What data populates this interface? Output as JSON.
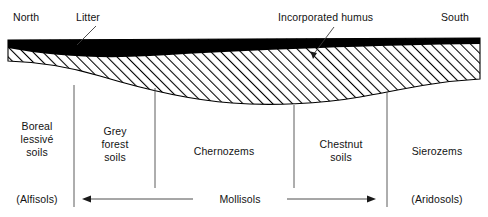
{
  "figure": {
    "type": "soil-profile-cross-section",
    "orientation_labels": {
      "left": "North",
      "right": "South"
    },
    "callouts": [
      {
        "label": "Litter",
        "target": "black-surface-band"
      },
      {
        "label": "Incorporated humus",
        "target": "hatched-band"
      }
    ],
    "layers": [
      {
        "name": "Litter",
        "fill": "black",
        "color": "#000000"
      },
      {
        "name": "Incorporated humus",
        "fill": "diagonal-hatch",
        "color": "#000000"
      }
    ],
    "zones": [
      {
        "name": "Boreal\nlessivé\nsoils",
        "order": "(Alfisols)",
        "center_x": 37
      },
      {
        "name": "Grey\nforest\nsoils",
        "order": "",
        "center_x": 115
      },
      {
        "name": "Chernozems",
        "order": "",
        "center_x": 224
      },
      {
        "name": "Chestnut\nsoils",
        "order": "",
        "center_x": 341
      },
      {
        "name": "Sierozems",
        "order": "(Aridosols)",
        "center_x": 437
      }
    ],
    "soil_orders": [
      {
        "label": "(Alfisols)",
        "x": 37
      },
      {
        "label": "Mollisols",
        "x": 244
      },
      {
        "label": "(Aridosols)",
        "x": 437
      }
    ],
    "mollisols_span": {
      "label": "Mollisols",
      "left_arrow": true,
      "right_arrow": true
    },
    "dividers_x": [
      74,
      155,
      294,
      387
    ],
    "colors": {
      "ink": "#000000",
      "text": "#131313",
      "background": "#ffffff"
    }
  }
}
